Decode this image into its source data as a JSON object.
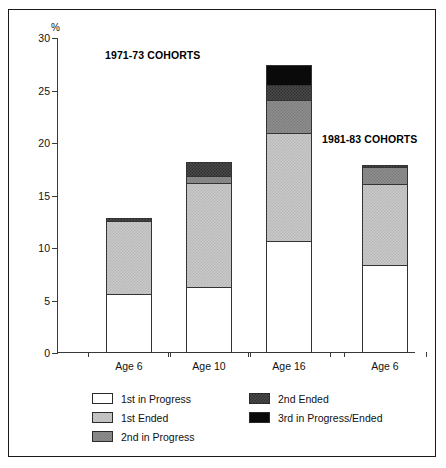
{
  "chart": {
    "type": "bar",
    "percent_symbol": "%",
    "cohort_titles": {
      "first": "1971-73 COHORTS",
      "second": "1981-83 COHORTS"
    }
  },
  "chart_data": {
    "type": "bar",
    "title": "",
    "subtitle": "",
    "stacked": true,
    "xlabel": "",
    "ylabel": "%",
    "ylim": [
      0,
      30
    ],
    "yticks": [
      0,
      5,
      10,
      15,
      20,
      25,
      30
    ],
    "ytick_labels": [
      "0",
      "5",
      "10",
      "15",
      "20",
      "25",
      "30"
    ],
    "grid": false,
    "legend_position": "bottom",
    "categories": [
      "Age 6",
      "Age 10",
      "Age 16",
      "Age 6"
    ],
    "group_labels": [
      "1971-73 COHORTS",
      "1971-73 COHORTS",
      "1971-73 COHORTS",
      "1981-83 COHORTS"
    ],
    "series": [
      {
        "name": "1st in Progress",
        "color": "#ffffff",
        "values": [
          5.5,
          6.2,
          10.6,
          8.3
        ]
      },
      {
        "name": "1st Ended",
        "color": "#c9c9c9",
        "values": [
          7.0,
          9.9,
          10.3,
          7.7
        ]
      },
      {
        "name": "2nd in Progress",
        "color": "#8e8e8e",
        "values": [
          0.0,
          0.7,
          3.1,
          1.6
        ]
      },
      {
        "name": "2nd Ended",
        "color": "#4a4a4a",
        "values": [
          0.4,
          1.4,
          1.4,
          0.3
        ]
      },
      {
        "name": "3rd in Progress/Ended",
        "color": "#0a0a0a",
        "values": [
          0.0,
          0.0,
          2.0,
          0.0
        ]
      }
    ],
    "totals": [
      12.9,
      18.2,
      27.4,
      17.9
    ],
    "cumulative_tops": [
      [
        5.5,
        12.5,
        12.5,
        12.9,
        12.9
      ],
      [
        6.2,
        16.1,
        16.8,
        18.2,
        18.2
      ],
      [
        10.6,
        20.9,
        24.0,
        25.4,
        27.4
      ],
      [
        8.3,
        16.0,
        17.6,
        17.9,
        17.9
      ]
    ]
  },
  "legend": {
    "left_column": [
      {
        "label": "1st in Progress",
        "swatch": "white-swatch"
      },
      {
        "label": "1st Ended",
        "swatch": "light-gray-swatch"
      },
      {
        "label": "2nd in Progress",
        "swatch": "medium-gray-swatch"
      }
    ],
    "right_column": [
      {
        "label": "2nd Ended",
        "swatch": "dark-gray-swatch"
      },
      {
        "label": "3rd in Progress/Ended",
        "swatch": "black-swatch"
      }
    ]
  }
}
